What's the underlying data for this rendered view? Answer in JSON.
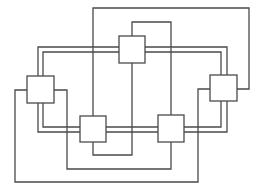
{
  "diagram": {
    "type": "network-graph",
    "colors": {
      "stroke": "#4a4a4a",
      "background": "#ffffff",
      "node_fill": "#ffffff"
    },
    "nodes": [
      {
        "id": "top"
      },
      {
        "id": "left"
      },
      {
        "id": "right"
      },
      {
        "id": "bottom-left"
      },
      {
        "id": "bottom-right"
      }
    ],
    "edges": [
      {
        "from": "left",
        "to": "top",
        "style": "double"
      },
      {
        "from": "top",
        "to": "right",
        "style": "double"
      },
      {
        "from": "left",
        "to": "bottom-left",
        "style": "double"
      },
      {
        "from": "bottom-left",
        "to": "bottom-right",
        "style": "double"
      },
      {
        "from": "bottom-right",
        "to": "right",
        "style": "double"
      },
      {
        "from": "top",
        "to": "bottom-left",
        "style": "single"
      },
      {
        "from": "top",
        "to": "bottom-right",
        "style": "single"
      },
      {
        "from": "bottom-left",
        "to": "right",
        "style": "single"
      },
      {
        "from": "left",
        "to": "bottom-right",
        "style": "single"
      },
      {
        "from": "left",
        "to": "right",
        "style": "single"
      }
    ]
  }
}
